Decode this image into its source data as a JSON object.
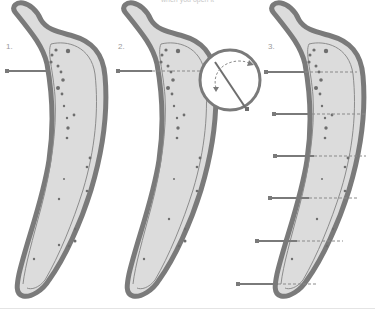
{
  "caption": "when you open it",
  "steps": [
    {
      "label": "1.",
      "x": 6,
      "y": 42
    },
    {
      "label": "2.",
      "x": 118,
      "y": 42
    },
    {
      "label": "3.",
      "x": 268,
      "y": 42
    }
  ],
  "colors": {
    "peel_outline": "#7a7a7a",
    "flesh_fill": "#dcdcdc",
    "inner_line": "#8c8c8c",
    "seeds": "#6e6e6e",
    "pin": "#7a7a7a",
    "dashed_cut": "#8a8a8a"
  },
  "banana_3_pin_rows_y": [
    72,
    114,
    156,
    198,
    241,
    284
  ]
}
